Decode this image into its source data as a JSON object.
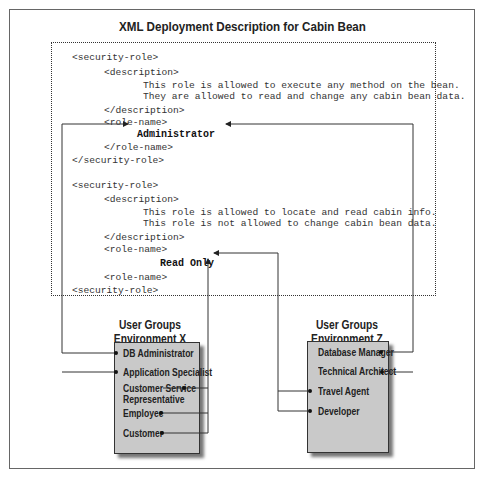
{
  "title": "XML Deployment Description for Cabin Bean",
  "xml": {
    "role1": {
      "open": "<security-role>",
      "desc_open": "<description>",
      "desc_line1": "This role is allowed to execute any method on the bean.",
      "desc_line2": "They are allowed to read and change any cabin bean data.",
      "desc_close": "</description>",
      "name_open": "<role-name>",
      "name": "Administrator",
      "name_close": "</role-name>",
      "close": "</security-role>"
    },
    "role2": {
      "open": "<security-role>",
      "desc_open": "<description>",
      "desc_line1": "This role is allowed to locate and read cabin info.",
      "desc_line2": "This role is not allowed to change cabin bean data.",
      "desc_close": "</description>",
      "name_open": "<role-name>",
      "name": "Read Only",
      "name_close": "<role-name>",
      "close": "<security-role>"
    }
  },
  "groups": {
    "x": {
      "title_line1": "User Groups",
      "title_line2": "Environment X",
      "members": [
        "DB Administrator",
        "Application Specialist",
        "Customer Service",
        "Representative",
        "Employee",
        "Customer"
      ]
    },
    "z": {
      "title_line1": "User Groups",
      "title_line2": "Environment Z",
      "members": [
        "Database Manager",
        "Technical Architect",
        "Travel Agent",
        "Developer"
      ]
    }
  },
  "mappings": [
    {
      "role": "Administrator",
      "groups": [
        "DB Administrator",
        "Application Specialist",
        "Database Manager",
        "Technical Architect"
      ]
    },
    {
      "role": "Read Only",
      "groups": [
        "Customer Service Representative",
        "Employee",
        "Customer",
        "Travel Agent",
        "Developer"
      ]
    }
  ]
}
